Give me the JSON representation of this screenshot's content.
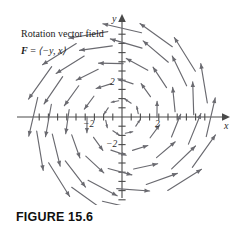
{
  "figure": {
    "caption": "FIGURE 15.6",
    "annotation": {
      "line1": "Rotation vector field",
      "vector_symbol": "F",
      "equals": " = ",
      "components": "⟨−y, x⟩",
      "line2_full": "F = ⟨−y, x⟩"
    },
    "axes": {
      "x_label": "x",
      "y_label": "y"
    },
    "tick_labels": {
      "x_negative": "−2",
      "x_positive": "2",
      "y_positive": "2",
      "y_negative": "−2"
    },
    "colors": {
      "axis": "#4a4a4a",
      "vector": "#6a6a70",
      "text": "#1c1c1c",
      "background": "#ffffff"
    }
  },
  "chart_data": {
    "type": "scatter",
    "title": "Rotation vector field",
    "subtitle": "F = ⟨−y, x⟩",
    "xlabel": "x",
    "ylabel": "y",
    "xlim": [
      -5.5,
      5.5
    ],
    "ylim": [
      -5.5,
      5.5
    ],
    "grid": false,
    "legend": "none",
    "xticks": [
      -4.5,
      -4,
      -3.5,
      -3,
      -2.5,
      -2,
      -1.5,
      -1,
      -0.5,
      0.5,
      1,
      1.5,
      2,
      2.5,
      3,
      3.5,
      4,
      4.5
    ],
    "xtick_labels": [
      {
        "value": -2,
        "text": "−2"
      },
      {
        "value": 2,
        "text": "2"
      }
    ],
    "yticks": [
      -4.5,
      -4,
      -3.5,
      -3,
      -2.5,
      -2,
      -1.5,
      -1,
      -0.5,
      0.5,
      1,
      1.5,
      2,
      2.5,
      3,
      3.5,
      4,
      4.5
    ],
    "ytick_labels": [
      {
        "value": 2,
        "text": "2"
      },
      {
        "value": -2,
        "text": "−2"
      }
    ],
    "field_formula": {
      "u": "-y",
      "v": "x",
      "description": "Counterclockwise rotation; magnitude proportional to distance from origin"
    },
    "rings": [
      {
        "radius": 0.9,
        "count": 8,
        "phase": 0.2
      },
      {
        "radius": 1.9,
        "count": 10,
        "phase": 0.62
      },
      {
        "radius": 2.9,
        "count": 13,
        "phase": 0.1
      },
      {
        "radius": 3.9,
        "count": 15,
        "phase": 0.45
      },
      {
        "radius": 4.7,
        "count": 16,
        "phase": 0.95
      }
    ],
    "arrow_length_scale": 0.46,
    "units_per_tick": 0.5
  }
}
